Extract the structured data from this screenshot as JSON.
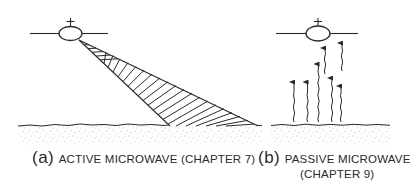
{
  "figure": {
    "panels": [
      {
        "id": "a",
        "tag": "(a)",
        "label": "ACTIVE MICROWAVE (CHAPTER 7)",
        "elements": [
          "satellite",
          "radar-beam (hatched, slanted to ground)",
          "ground surface (stippled)"
        ]
      },
      {
        "id": "b",
        "tag": "(b)",
        "label_line1": "PASSIVE MICROWAVE",
        "label_line2": "(CHAPTER 9)",
        "elements": [
          "satellite",
          "wavy upward emission arrows",
          "ground surface (stippled)"
        ]
      }
    ],
    "colors": {
      "ink": "#2a2a2a",
      "background": "#ffffff",
      "stipple": "#8a8a8a"
    }
  }
}
